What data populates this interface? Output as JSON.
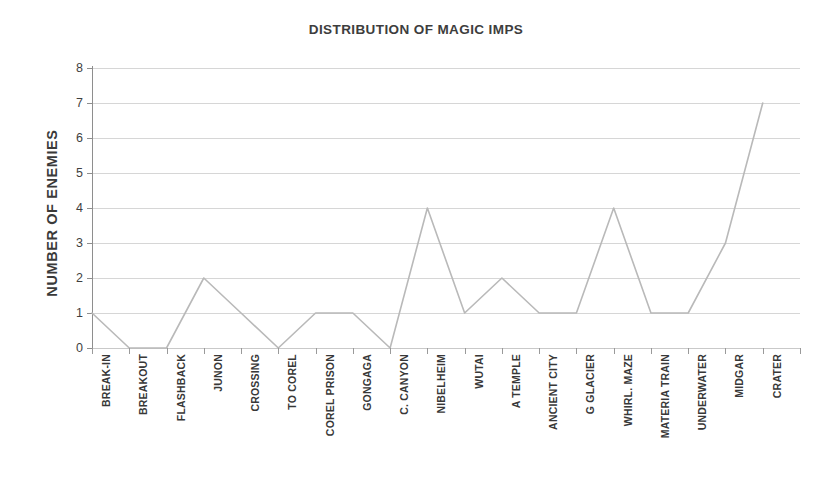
{
  "chart_data": {
    "type": "line",
    "title": "DISTRIBUTION OF MAGIC IMPS",
    "xlabel": "",
    "ylabel": "NUMBER OF ENEMIES",
    "ylim": [
      0,
      8
    ],
    "ytick_labels": [
      "8",
      "7",
      "6",
      "5",
      "4",
      "3",
      "2",
      "1",
      "0"
    ],
    "ytick_values": [
      8,
      7,
      6,
      5,
      4,
      3,
      2,
      1,
      0
    ],
    "grid": true,
    "legend": "none",
    "line_color": "#b9b9b9",
    "grid_color": "#d6d6d6",
    "axis_color": "#8e8e8e",
    "categories": [
      "BREAK-IN",
      "BREAKOUT",
      "FLASHBACK",
      "JUNON",
      "CROSSING",
      "TO COREL",
      "COREL PRISON",
      "GONGAGA",
      "C. CANYON",
      "NIBELHEIM",
      "WUTAI",
      "A TEMPLE",
      "ANCIENT CITY",
      "G GLACIER",
      "WHIRL. MAZE",
      "MATERIA TRAIN",
      "UNDERWATER",
      "MIDGAR",
      "CRATER"
    ],
    "values": [
      1,
      0,
      0,
      2,
      1,
      0,
      1,
      1,
      0,
      4,
      1,
      2,
      1,
      1,
      4,
      1,
      1,
      3,
      7
    ],
    "series": [
      {
        "name": "MAGIC IMPS",
        "values": [
          1,
          0,
          0,
          2,
          1,
          0,
          1,
          1,
          0,
          4,
          1,
          2,
          1,
          1,
          4,
          1,
          1,
          3,
          7
        ]
      }
    ]
  }
}
